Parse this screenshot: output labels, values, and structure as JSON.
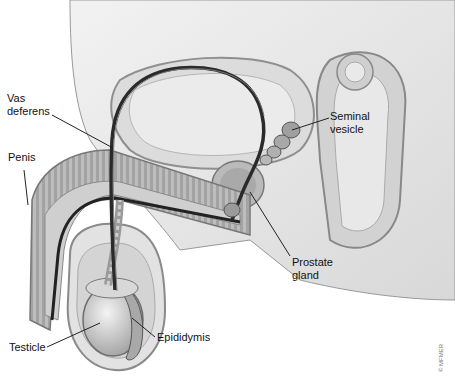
{
  "figure": {
    "labels": {
      "vas_deferens": [
        "Vas",
        "deferens"
      ],
      "penis": "Penis",
      "seminal_vesicle": [
        "Seminal",
        "vesicle"
      ],
      "prostate_gland": [
        "Prostate",
        "gland"
      ],
      "testicle": "Testicle",
      "epididymis": "Epididymis"
    },
    "credit": "© MFMER"
  },
  "colors": {
    "background": "#ffffff",
    "tissue_light": "#e6e6e6",
    "tissue_mid": "#c4c4c4",
    "tissue_dark": "#8a8a8a",
    "duct": "#2a2a2a",
    "leader_line": "#222222"
  }
}
